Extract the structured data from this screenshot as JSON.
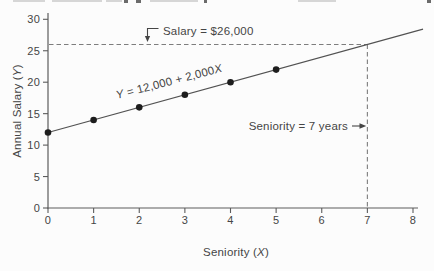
{
  "page": {
    "background": "#fcfcfc"
  },
  "chart_data": {
    "type": "scatter",
    "title": "",
    "xlabel": "Seniority (X)",
    "ylabel": "Annual Salary (Y)",
    "xlim": [
      0,
      8
    ],
    "ylim": [
      0,
      30
    ],
    "xticks": [
      "0",
      "1",
      "2",
      "3",
      "4",
      "5",
      "6",
      "7",
      "8"
    ],
    "yticks": [
      "0",
      "5",
      "10",
      "15",
      "20",
      "25",
      "30"
    ],
    "grid": false,
    "legend": false,
    "series": [
      {
        "name": "observed-salaries",
        "type": "scatter",
        "points": [
          [
            0,
            12
          ],
          [
            1,
            14
          ],
          [
            2,
            16
          ],
          [
            3,
            18
          ],
          [
            4,
            20
          ],
          [
            5,
            22
          ]
        ]
      },
      {
        "name": "regression-line",
        "type": "line",
        "equation_label": "Y = 12,000 + 2,000X",
        "intercept": 12,
        "slope": 2,
        "x_start": 0,
        "x_end": 8.22
      }
    ],
    "reference_lines": [
      {
        "axis": "y",
        "value": 26,
        "style": "dashed",
        "label": "Salary = $26,000"
      },
      {
        "axis": "x",
        "value": 7,
        "style": "dashed",
        "label": "Seniority = 7 years"
      }
    ],
    "colors": {
      "axis": "#5c5c5c",
      "line": "#525252",
      "point": "#1d1d1d",
      "dashed": "#7d7d7d",
      "text": "#454545"
    }
  }
}
